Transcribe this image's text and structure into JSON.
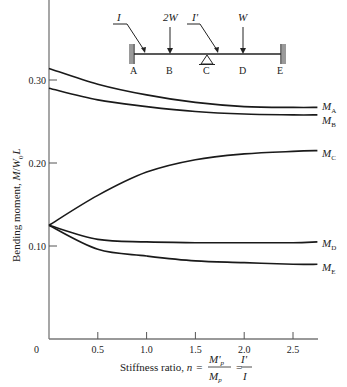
{
  "chart_data": {
    "type": "line",
    "title": "",
    "xlabel": "Stiffness ratio, n = M'p / Mp = I' / I",
    "xlabel_parts": {
      "prefix": "Stiffness ratio, ",
      "n": "n",
      "eq": "=",
      "num1": "M'",
      "num1_sub": "p",
      "den1": "M",
      "den1_sub": "p",
      "num2": "I'",
      "den2": "I"
    },
    "ylabel": "Bending moment, M/W₀L",
    "ylabel_parts": {
      "text": "Bending moment, ",
      "M": "M",
      "slash": "/",
      "W": "W",
      "sub": "0",
      "L": "L"
    },
    "xlim": [
      0,
      2.75
    ],
    "ylim": [
      0,
      0.4
    ],
    "grid": false,
    "x_ticks": [
      0.5,
      1.0,
      1.5,
      2.0,
      2.5
    ],
    "x_tick_labels": [
      "0.5",
      "1.0",
      "1.5",
      "2.0",
      "2.5"
    ],
    "x_origin_label": "0",
    "y_ticks": [
      0.1,
      0.2,
      0.3
    ],
    "y_tick_labels": [
      "0.10",
      "0.20",
      "0.30"
    ],
    "x": [
      0,
      0.5,
      1.0,
      1.5,
      2.0,
      2.5,
      2.75
    ],
    "series": [
      {
        "name": "M_A",
        "label": "M",
        "sub": "A",
        "values": [
          0.314,
          0.295,
          0.282,
          0.273,
          0.268,
          0.267,
          0.267
        ]
      },
      {
        "name": "M_B",
        "label": "M",
        "sub": "B",
        "values": [
          0.29,
          0.276,
          0.268,
          0.262,
          0.259,
          0.258,
          0.258
        ]
      },
      {
        "name": "M_C",
        "label": "M",
        "sub": "C",
        "values": [
          0.125,
          0.161,
          0.189,
          0.204,
          0.211,
          0.214,
          0.215
        ]
      },
      {
        "name": "M_D",
        "label": "M",
        "sub": "D",
        "values": [
          0.125,
          0.108,
          0.105,
          0.104,
          0.104,
          0.104,
          0.105
        ]
      },
      {
        "name": "M_E",
        "label": "M",
        "sub": "E",
        "values": [
          0.125,
          0.096,
          0.088,
          0.082,
          0.08,
          0.078,
          0.078
        ]
      }
    ],
    "inset_diagram": {
      "description": "Two-span beam fixed at A and E, supported at C",
      "points": [
        "A",
        "B",
        "C",
        "D",
        "E"
      ],
      "loads": [
        {
          "at": "B",
          "label": "2W"
        },
        {
          "at": "D",
          "label": "W"
        }
      ],
      "member_labels": [
        {
          "span": "A-C",
          "label": "I"
        },
        {
          "span": "C-E",
          "label": "I'"
        }
      ]
    }
  }
}
